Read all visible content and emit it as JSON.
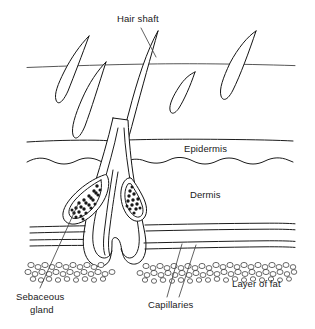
{
  "diagram": {
    "type": "anatomical-cross-section",
    "canvas": {
      "width": 315,
      "height": 329
    },
    "style": {
      "background": "#ffffff",
      "ink": "#141414",
      "text": "#1a1a1a",
      "line_weight": "thin-pen"
    },
    "labels": {
      "hair_shaft": "Hair shaft",
      "epidermis": "Epidermis",
      "dermis": "Dermis",
      "sebaceous_gland_line1": "Sebaceous",
      "sebaceous_gland_line2": "gland",
      "capillaries": "Capillaries",
      "layer_of_fat": "Layer of fat"
    },
    "layers": [
      {
        "name": "skin-surface",
        "label": "",
        "y_approx": 68,
        "description": "outer skin surface line with emerging hairs"
      },
      {
        "name": "epidermis",
        "label": "Epidermis",
        "y_top": 137,
        "y_bottom": 163,
        "description": "band between straight upper line and wavy lower line"
      },
      {
        "name": "dermis",
        "label": "Dermis",
        "y_top": 163,
        "y_bottom": 265,
        "description": "contains follicle, sebaceous glands and capillaries"
      },
      {
        "name": "layer-of-fat",
        "label": "Layer of fat",
        "y_top": 262,
        "y_bottom": 283,
        "description": "band of small round fat cells"
      }
    ],
    "structures": [
      {
        "name": "hair-shaft",
        "count": 5,
        "label": "Hair shaft"
      },
      {
        "name": "hair-follicle",
        "count": 1,
        "label": ""
      },
      {
        "name": "sebaceous-gland",
        "count": 2,
        "label": "Sebaceous gland"
      },
      {
        "name": "capillary-band",
        "count": 2,
        "label": "Capillaries"
      },
      {
        "name": "fat-cell-band",
        "count": 1,
        "label": "Layer of fat"
      }
    ],
    "label_positions": {
      "hair_shaft": {
        "x": 117,
        "y": 22,
        "anchor": "start"
      },
      "epidermis": {
        "x": 184,
        "y": 152,
        "anchor": "start"
      },
      "dermis": {
        "x": 190,
        "y": 198,
        "anchor": "start"
      },
      "sebaceous_gland": {
        "x": 16,
        "y": 300,
        "anchor": "start"
      },
      "capillaries": {
        "x": 148,
        "y": 308,
        "anchor": "start"
      },
      "layer_of_fat": {
        "x": 232,
        "y": 287,
        "anchor": "start"
      }
    }
  }
}
